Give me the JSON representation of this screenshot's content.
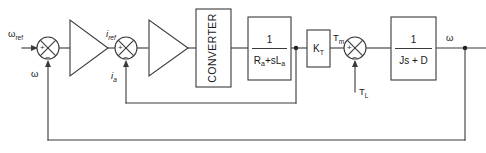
{
  "diagram": {
    "type": "control-system-block-diagram",
    "canvas": {
      "width": 486,
      "height": 153
    },
    "colors": {
      "background": "#ffffff",
      "line": "#3a3a3a",
      "text": "#1a1a1a"
    },
    "signals": {
      "input_reference": "ω",
      "input_reference_sub": "ref",
      "speed_feedback": "ω",
      "current_reference": "i",
      "current_reference_sub": "ref",
      "current_feedback": "i",
      "current_feedback_sub": "a",
      "motor_torque": "T",
      "motor_torque_sub": "m",
      "load_torque": "T",
      "load_torque_sub": "L",
      "output_speed": "ω"
    },
    "summing_junctions": [
      {
        "name": "speed-error-junction",
        "plus": "+",
        "minus": "−"
      },
      {
        "name": "current-error-junction",
        "plus": "+",
        "minus": "−"
      },
      {
        "name": "torque-junction",
        "plus": "+",
        "minus": "−"
      }
    ],
    "blocks": [
      {
        "name": "speed-controller",
        "shape": "triangle",
        "label": ""
      },
      {
        "name": "current-controller",
        "shape": "triangle",
        "label": ""
      },
      {
        "name": "converter",
        "shape": "rect",
        "label": "CONVERTER",
        "orientation": "vertical"
      },
      {
        "name": "armature-transfer-function",
        "shape": "rect",
        "numerator": "1",
        "denominator_main": "R",
        "denominator_sub1": "a",
        "denominator_mid": "+sL",
        "denominator_sub2": "a"
      },
      {
        "name": "torque-constant",
        "shape": "rect",
        "label": "K",
        "label_sub": "T"
      },
      {
        "name": "mechanical-transfer-function",
        "shape": "rect",
        "numerator": "1",
        "denominator": "Js + D"
      }
    ],
    "feedback_loops": [
      {
        "name": "inner-current-loop",
        "from": "armature-transfer-function-output",
        "to": "current-error-junction"
      },
      {
        "name": "outer-speed-loop",
        "from": "mechanical-transfer-function-output",
        "to": "speed-error-junction"
      }
    ]
  }
}
